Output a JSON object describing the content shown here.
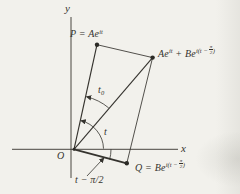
{
  "figure": {
    "title_semantic": "phasor-addition-diagram",
    "background": "#f2f1ec",
    "ink": "#35332e",
    "axes": {
      "x_label": "x",
      "y_label": "y",
      "origin_label": "O"
    },
    "points": {
      "p": {
        "base": "P = Ae",
        "sup": "it"
      },
      "sum": {
        "base1": "Ae",
        "sup1": "it",
        "base2": " + Be",
        "sup2_open": "i(t − ",
        "frac_num": "π",
        "frac_den": "2",
        "sup2_close": ")"
      },
      "q": {
        "base": "Q = Be",
        "sup_open": "i(t − ",
        "frac_num": "π",
        "frac_den": "2",
        "sup_close": ")"
      }
    },
    "angles": {
      "t": "t",
      "t0_base": "t",
      "t0_sub": "0",
      "lag": "t − π/2"
    }
  }
}
